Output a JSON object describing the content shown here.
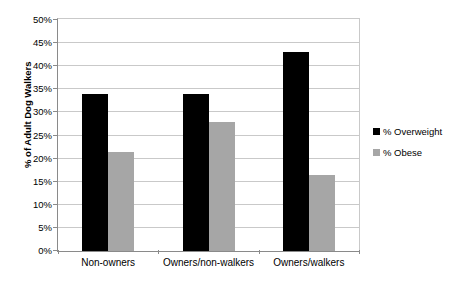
{
  "chart_data": {
    "type": "bar",
    "title": "",
    "xlabel": "",
    "ylabel": "% of Adult Dog Walkers",
    "ylim": [
      0,
      50
    ],
    "ytick_step": 5,
    "ytick_labels": [
      "50%",
      "45%",
      "40%",
      "35%",
      "30%",
      "25%",
      "20%",
      "15%",
      "10%",
      "5%",
      "0%"
    ],
    "ytick_values": [
      50,
      45,
      40,
      35,
      30,
      25,
      20,
      15,
      10,
      5,
      0
    ],
    "categories": [
      "Non-owners",
      "Owners/non-walkers",
      "Owners/walkers"
    ],
    "series": [
      {
        "name": "% Overweight",
        "color": "#000000",
        "values": [
          34,
          34,
          43
        ]
      },
      {
        "name": "% Obese",
        "color": "#a6a6a6",
        "values": [
          21.5,
          28,
          16.5
        ]
      }
    ],
    "grid": true,
    "grid_axis": "y",
    "legend_position": "right"
  }
}
